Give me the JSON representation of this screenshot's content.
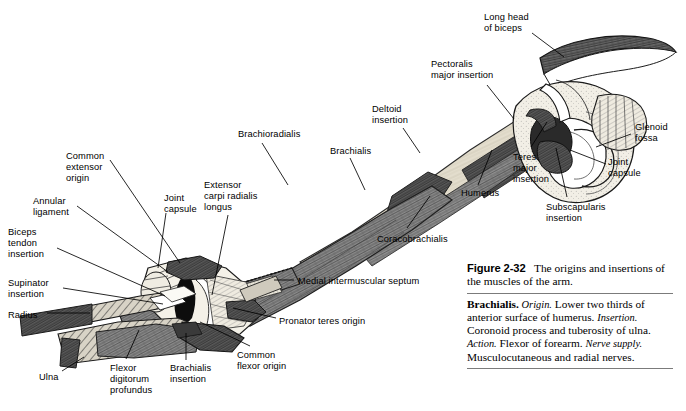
{
  "figure": {
    "title_prefix": "Figure 2-32",
    "title_text": "The origins and insertions of the muscles of the arm.",
    "body": {
      "muscle": "Brachialis.",
      "origin_label": "Origin.",
      "origin_text": "Lower two thirds of anterior surface of humerus.",
      "insertion_label": "Insertion.",
      "insertion_text": "Coronoid process and tuberosity of ulna.",
      "action_label": "Action.",
      "action_text": "Flexor of forearm.",
      "nerve_label": "Nerve supply.",
      "nerve_text": "Musculocutaneous and radial nerves."
    }
  },
  "labels": [
    {
      "id": "long-head-of-biceps",
      "text": "Long head\nof biceps",
      "x": 484,
      "y": 12,
      "align": "left"
    },
    {
      "id": "pectoralis-major-insertion",
      "text": "Pectoralis\nmajor insertion",
      "x": 431,
      "y": 59,
      "align": "left"
    },
    {
      "id": "deltoid-insertion",
      "text": "Deltoid\ninsertion",
      "x": 372,
      "y": 104,
      "align": "left"
    },
    {
      "id": "glenoid-fossa",
      "text": "Glenoid\nfossa",
      "x": 635,
      "y": 122,
      "align": "left"
    },
    {
      "id": "joint-capsule-right",
      "text": "Joint\ncapsule",
      "x": 608,
      "y": 157,
      "align": "left"
    },
    {
      "id": "teres-major-insertion",
      "text": "Teres\nmajor\ninsertion",
      "x": 513,
      "y": 152,
      "align": "left"
    },
    {
      "id": "subscapularis-insertion",
      "text": "Subscapularis\ninsertion",
      "x": 546,
      "y": 202,
      "align": "left"
    },
    {
      "id": "brachioradialis",
      "text": "Brachioradialis",
      "x": 238,
      "y": 129,
      "align": "left"
    },
    {
      "id": "brachialis",
      "text": "Brachialis",
      "x": 330,
      "y": 146,
      "align": "left"
    },
    {
      "id": "humerus",
      "text": "Humerus",
      "x": 461,
      "y": 188,
      "align": "left"
    },
    {
      "id": "coracobrachialis",
      "text": "Coracobrachialis",
      "x": 377,
      "y": 234,
      "align": "left"
    },
    {
      "id": "common-extensor-origin",
      "text": "Common\nextensor\norigin",
      "x": 66,
      "y": 151,
      "align": "left"
    },
    {
      "id": "annular-ligament",
      "text": "Annular\nligament",
      "x": 33,
      "y": 196,
      "align": "left"
    },
    {
      "id": "joint-capsule-left",
      "text": "Joint\ncapsule",
      "x": 164,
      "y": 193,
      "align": "left"
    },
    {
      "id": "extensor-carpi-radialis-longus",
      "text": "Extensor\ncarpi radialis\nlongus",
      "x": 204,
      "y": 180,
      "align": "left"
    },
    {
      "id": "biceps-tendon-insertion",
      "text": "Biceps\ntendon\ninsertion",
      "x": 8,
      "y": 227,
      "align": "left"
    },
    {
      "id": "supinator-insertion",
      "text": "Supinator\ninsertion",
      "x": 8,
      "y": 278,
      "align": "left"
    },
    {
      "id": "radius",
      "text": "Radius",
      "x": 8,
      "y": 310,
      "align": "left"
    },
    {
      "id": "ulna",
      "text": "Ulna",
      "x": 39,
      "y": 372,
      "align": "left"
    },
    {
      "id": "flexor-digitorum-profundus",
      "text": "Flexor\ndigitorum\nprofundus",
      "x": 110,
      "y": 363,
      "align": "left"
    },
    {
      "id": "brachialis-insertion",
      "text": "Brachialis\ninsertion",
      "x": 170,
      "y": 363,
      "align": "left"
    },
    {
      "id": "common-flexor-origin",
      "text": "Common\nflexor origin",
      "x": 237,
      "y": 350,
      "align": "left"
    },
    {
      "id": "pronator-teres-origin",
      "text": "Pronator teres origin",
      "x": 279,
      "y": 316,
      "align": "left"
    },
    {
      "id": "medial-intermuscular-septum",
      "text": "Medial intermuscular septum",
      "x": 298,
      "y": 276,
      "align": "left"
    }
  ],
  "leaders": [
    {
      "id": "leader-long-head-of-biceps",
      "d": "M 532 33 L 564 57"
    },
    {
      "id": "leader-pectoralis-major-insertion",
      "d": "M 487 85 L 514 119"
    },
    {
      "id": "leader-deltoid-insertion",
      "d": "M 403 128 L 420 153"
    },
    {
      "id": "leader-glenoid-fossa",
      "d": "M 631 134 L 596 147"
    },
    {
      "id": "leader-joint-capsule-right",
      "d": "M 606 164 L 570 150"
    },
    {
      "id": "leader-teres-major-insertion",
      "d": "M 531 147 L 547 122"
    },
    {
      "id": "leader-subscapularis-insertion",
      "d": "M 567 197 L 556 148"
    },
    {
      "id": "leader-brachioradialis",
      "d": "M 262 143 L 288 185"
    },
    {
      "id": "leader-brachialis",
      "d": "M 350 158 L 365 190"
    },
    {
      "id": "leader-humerus",
      "d": "M 478 185 L 492 150"
    },
    {
      "id": "leader-coracobrachialis",
      "d": "M 407 228 L 430 196"
    },
    {
      "id": "leader-common-extensor-origin",
      "d": "M 110 160 L 180 263"
    },
    {
      "id": "leader-annular-ligament",
      "d": "M 77 206 L 168 272"
    },
    {
      "id": "leader-joint-capsule-left",
      "d": "M 166 213 L 158 268"
    },
    {
      "id": "leader-extensor-carpi-radialis-longus",
      "d": "M 228 215 L 212 295"
    },
    {
      "id": "leader-biceps-tendon-insertion",
      "d": "M 57 248 L 165 296"
    },
    {
      "id": "leader-supinator-insertion",
      "d": "M 63 288 L 163 304"
    },
    {
      "id": "leader-radius",
      "d": "M 47 313 L 90 313"
    },
    {
      "id": "leader-ulna",
      "d": "M 62 371 L 84 357"
    },
    {
      "id": "leader-flexor-digitorum-profundus",
      "d": "M 126 359 L 139 330"
    },
    {
      "id": "leader-brachialis-insertion",
      "d": "M 186 360 L 186 333"
    },
    {
      "id": "leader-common-flexor-origin",
      "d": "M 250 346 L 200 322"
    },
    {
      "id": "leader-pronator-teres-origin",
      "d": "M 276 318 L 233 308"
    },
    {
      "id": "leader-medial-intermuscular-septum",
      "d": "M 294 280 L 274 280"
    }
  ]
}
